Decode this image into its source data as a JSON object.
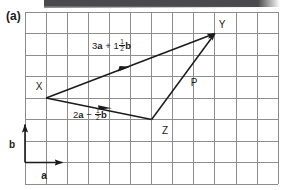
{
  "figure": {
    "part_label": "(a)",
    "points": [
      {
        "name": "X",
        "label": "X",
        "x": 2,
        "y": 4
      },
      {
        "name": "Y",
        "label": "Y",
        "x": 10,
        "y": 8
      },
      {
        "name": "Z",
        "label": "Z",
        "x": 7,
        "y": 3
      },
      {
        "name": "P",
        "label": "P"
      }
    ],
    "axes": {
      "a_label": "a",
      "b_label": "b"
    },
    "vectors": [
      {
        "name": "vector-xy",
        "from": "X",
        "to": "Y",
        "coefficient_a": "3",
        "symbol_a": "a",
        "operator": "+",
        "coefficient_b_whole": "1",
        "coefficient_b_num": "1",
        "coefficient_b_den": "2",
        "symbol_b": "b"
      },
      {
        "name": "vector-xz",
        "from": "X",
        "to": "Z",
        "coefficient_a": "2",
        "symbol_a": "a",
        "operator": "−",
        "coefficient_b_whole": "",
        "coefficient_b_num": "1",
        "coefficient_b_den": "2",
        "symbol_b": "b"
      },
      {
        "name": "vector-zy",
        "from": "Z",
        "to": "Y",
        "label": "P"
      }
    ],
    "colors": {
      "grid": "#8d8d8f",
      "ink": "#1b1b1b",
      "background": "#ffffff",
      "page_edge": "#4a4a4c"
    },
    "grid": {
      "columns": 12,
      "rows": 8,
      "cell_size": 21.5
    }
  }
}
